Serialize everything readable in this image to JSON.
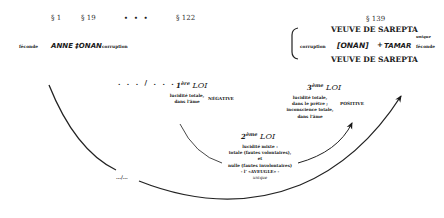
{
  "header": {
    "sections": [
      "§ 1",
      "§ 19",
      "• • •",
      "§ 122",
      "§ 139"
    ]
  },
  "left_row": {
    "label_left": "féconde",
    "names": "ANNE ‡ONAN",
    "label_right": "corruption"
  },
  "right_group": {
    "top": "VEUVE DE SAREPTA",
    "corruption_label": "corruption",
    "boxed_name": "ONAN",
    "plus": "+",
    "name_right": "TAMAR",
    "superscript": "unique",
    "fecond_label": "féconde",
    "bottom": "VEUVE DE SAREPTA"
  },
  "middle_separator": ". . . / . . .",
  "bottom_separator": "…/…",
  "laws": [
    {
      "num": "1",
      "ordinal": "ère",
      "word": "LOI",
      "desc": [
        "lucidité totale,",
        "dans l'âme"
      ],
      "polarity": "NÉGATIVE"
    },
    {
      "num": "2",
      "ordinal": "ème",
      "word": "LOI",
      "desc": [
        "lucidité mixte :",
        "totale (fautes volontaires),",
        "et",
        "nulle (fautes involontaires)",
        "- l' «AVEUGLE» -",
        "unique"
      ]
    },
    {
      "num": "3",
      "ordinal": "ème",
      "word": "LOI",
      "desc": [
        "lucidité totale,",
        "dans le prêtre ;",
        "inconscience totale,",
        "dans l'âme"
      ],
      "polarity": "POSITIVE"
    }
  ]
}
